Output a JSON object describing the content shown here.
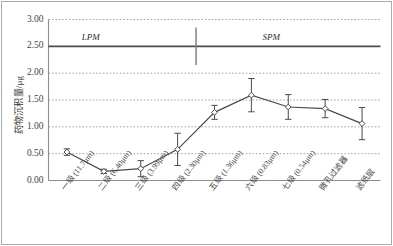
{
  "chart_data": {
    "type": "line",
    "title": "",
    "xlabel": "",
    "ylabel": "药物沉积量/μg",
    "ylim": [
      0.0,
      3.0
    ],
    "ytick_labels": [
      "0.00",
      "0.50",
      "1.00",
      "1.50",
      "2.00",
      "2.50",
      "3.00"
    ],
    "ytick_values": [
      0.0,
      0.5,
      1.0,
      1.5,
      2.0,
      2.5,
      3.0
    ],
    "grid": "horizontal-dotted",
    "legend": "none",
    "categories": [
      "一级 (11.7μm)",
      "二级 (6.40μm)",
      "三级 (3.99μm)",
      "四级 (2.30μm)",
      "五级 (1.36μm)",
      "六级 (0.83μm)",
      "七级 (0.54μm)",
      "微孔过滤器",
      "滤纸层"
    ],
    "series": [
      {
        "name": "药物沉积量",
        "values": [
          0.53,
          0.17,
          0.22,
          0.58,
          1.27,
          1.59,
          1.37,
          1.34,
          1.06
        ],
        "errors": [
          0.06,
          0.04,
          0.15,
          0.3,
          0.13,
          0.31,
          0.23,
          0.17,
          0.3
        ],
        "marker": "open-diamond",
        "line_color": "#4a4a4a"
      }
    ],
    "annotations": [
      {
        "text": "LPM",
        "x_category_index": 0.7,
        "y": 2.66
      },
      {
        "text": "SPM",
        "x_category_index": 5.6,
        "y": 2.66
      }
    ],
    "reference_line": {
      "y": 2.5,
      "style": "solid",
      "color": "#4f4f4f"
    },
    "divider_line": {
      "x_category_index": 3.5,
      "y_from": 2.15,
      "y_to": 2.85,
      "color": "#7a7a7a"
    }
  },
  "colors": {
    "axis": "#8d8d8d",
    "grid": "#9a9a9a",
    "series": "#4a4a4a",
    "frame": "#aaaaaa",
    "text": "#3f3f3f"
  }
}
